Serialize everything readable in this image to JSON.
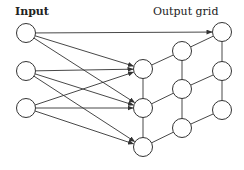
{
  "labels": {
    "input": "Input",
    "output": "Output grid"
  },
  "style": {
    "stroke": "#333333",
    "background": "#ffffff"
  },
  "node_radius": 9.5,
  "input_nodes": [
    {
      "id": "in1",
      "x": 26,
      "y": 33
    },
    {
      "id": "in2",
      "x": 26,
      "y": 71
    },
    {
      "id": "in3",
      "x": 26,
      "y": 108
    }
  ],
  "grid_nodes": [
    {
      "id": "g11",
      "x": 143,
      "y": 69
    },
    {
      "id": "g12",
      "x": 143,
      "y": 108
    },
    {
      "id": "g13",
      "x": 143,
      "y": 147
    },
    {
      "id": "g21",
      "x": 182,
      "y": 51
    },
    {
      "id": "g22",
      "x": 182,
      "y": 89
    },
    {
      "id": "g23",
      "x": 182,
      "y": 128
    },
    {
      "id": "g31",
      "x": 222,
      "y": 32
    },
    {
      "id": "g32",
      "x": 222,
      "y": 71
    },
    {
      "id": "g33",
      "x": 222,
      "y": 110
    }
  ],
  "arrows": [
    {
      "from": "in1",
      "to": "g31"
    },
    {
      "from": "in1",
      "to": "g11"
    },
    {
      "from": "in1",
      "to": "g12"
    },
    {
      "from": "in2",
      "to": "g11"
    },
    {
      "from": "in2",
      "to": "g12"
    },
    {
      "from": "in2",
      "to": "g13"
    },
    {
      "from": "in3",
      "to": "g11"
    },
    {
      "from": "in3",
      "to": "g12"
    },
    {
      "from": "in3",
      "to": "g13"
    }
  ],
  "grid_edges": [
    {
      "from": "g11",
      "to": "g12"
    },
    {
      "from": "g12",
      "to": "g13"
    },
    {
      "from": "g21",
      "to": "g22"
    },
    {
      "from": "g22",
      "to": "g23"
    },
    {
      "from": "g31",
      "to": "g32"
    },
    {
      "from": "g32",
      "to": "g33"
    },
    {
      "from": "g11",
      "to": "g21"
    },
    {
      "from": "g21",
      "to": "g31"
    },
    {
      "from": "g12",
      "to": "g22"
    },
    {
      "from": "g22",
      "to": "g32"
    },
    {
      "from": "g13",
      "to": "g23"
    },
    {
      "from": "g23",
      "to": "g33"
    }
  ]
}
